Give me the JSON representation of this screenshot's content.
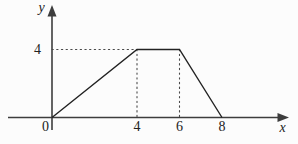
{
  "figure": {
    "background": "#fcfcfc",
    "ink_color": "#222222",
    "axis_color": "#3d3d3d",
    "guide_color": "#4a4a4a"
  },
  "chart_data": {
    "type": "line",
    "xlabel": "x",
    "ylabel": "y",
    "origin_label": "0",
    "points": [
      {
        "x": 0,
        "y": 0
      },
      {
        "x": 4,
        "y": 4
      },
      {
        "x": 6,
        "y": 4
      },
      {
        "x": 8,
        "y": 0
      }
    ],
    "x_ticks": [
      4,
      6,
      8
    ],
    "x_tick_labels": [
      "4",
      "6",
      "8"
    ],
    "y_ticks": [
      4
    ],
    "y_tick_labels": [
      "4"
    ],
    "xlim": [
      0,
      11
    ],
    "ylim": [
      0,
      6.4
    ],
    "grid": false,
    "legend": false,
    "dotted_guides": [
      {
        "from": {
          "x": 0,
          "y": 4
        },
        "to": {
          "x": 4,
          "y": 4
        }
      },
      {
        "from": {
          "x": 4,
          "y": 4
        },
        "to": {
          "x": 4,
          "y": 0
        }
      },
      {
        "from": {
          "x": 6,
          "y": 4
        },
        "to": {
          "x": 6,
          "y": 0
        }
      }
    ]
  }
}
